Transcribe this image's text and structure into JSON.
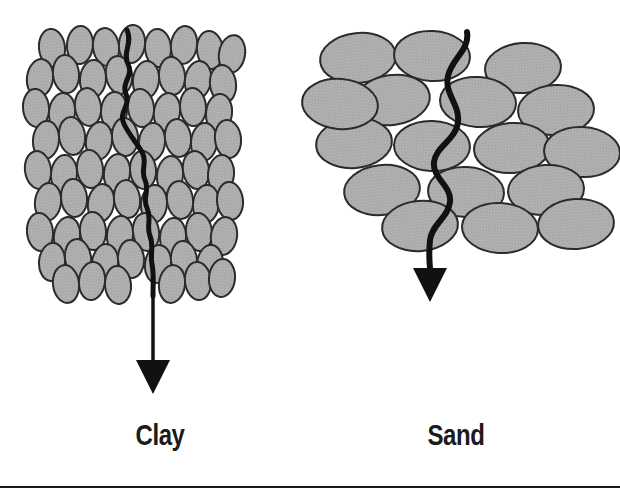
{
  "figure": {
    "width": 620,
    "height": 496,
    "background_color": "#ffffff"
  },
  "style": {
    "particle_fill": "#ababab",
    "particle_stroke": "#2b2b2b",
    "path_color": "#111111",
    "arrow_color": "#111111",
    "rule_color": "#1a1a1a",
    "caption_color": "#1b1b1b"
  },
  "panels": [
    {
      "id": "clay",
      "caption": "Clay",
      "caption_center_x": 160,
      "caption_baseline_y": 449,
      "particle_shape": "ellipse-vertical",
      "particle_count": 96,
      "particle_rx": 13,
      "particle_ry": 19,
      "packing": "dense",
      "block_bounds": {
        "x": 28,
        "y": 28,
        "width": 212,
        "height": 268
      },
      "path_description": "long tortuous vertical seepage path",
      "arrow": {
        "name": "clay-flow-arrow",
        "tip_y": 392,
        "length_below_block": 96,
        "head_width": 34,
        "head_height": 34
      }
    },
    {
      "id": "sand",
      "caption": "Sand",
      "caption_center_x": 456,
      "caption_baseline_y": 449,
      "particle_shape": "ellipse-horizontal",
      "particle_count": 17,
      "particle_rx": 38,
      "particle_ry": 25,
      "packing": "loose",
      "block_bounds": {
        "x": 318,
        "y": 28,
        "width": 276,
        "height": 218
      },
      "path_description": "short direct wavy seepage path",
      "arrow": {
        "name": "sand-flow-arrow",
        "tip_y": 300,
        "length_below_block": 56,
        "head_width": 34,
        "head_height": 34
      }
    }
  ],
  "rules": [
    {
      "name": "bottom-rule",
      "y": 486,
      "x1": 0,
      "x2": 620,
      "thickness": 2
    }
  ],
  "clay_particles": [
    {
      "cx": 52,
      "cy": 48,
      "r": -6
    },
    {
      "cx": 80,
      "cy": 45,
      "r": 4
    },
    {
      "cx": 106,
      "cy": 47,
      "r": -8
    },
    {
      "cx": 132,
      "cy": 44,
      "r": 6
    },
    {
      "cx": 158,
      "cy": 48,
      "r": -4
    },
    {
      "cx": 184,
      "cy": 45,
      "r": 8
    },
    {
      "cx": 210,
      "cy": 50,
      "r": -6
    },
    {
      "cx": 232,
      "cy": 54,
      "r": 10
    },
    {
      "cx": 40,
      "cy": 78,
      "r": 8
    },
    {
      "cx": 66,
      "cy": 74,
      "r": -6
    },
    {
      "cx": 93,
      "cy": 79,
      "r": 5
    },
    {
      "cx": 119,
      "cy": 75,
      "r": -9
    },
    {
      "cx": 146,
      "cy": 80,
      "r": 7
    },
    {
      "cx": 172,
      "cy": 76,
      "r": -5
    },
    {
      "cx": 198,
      "cy": 80,
      "r": 9
    },
    {
      "cx": 223,
      "cy": 84,
      "r": -7
    },
    {
      "cx": 36,
      "cy": 108,
      "r": -5
    },
    {
      "cx": 62,
      "cy": 112,
      "r": 7
    },
    {
      "cx": 88,
      "cy": 107,
      "r": -8
    },
    {
      "cx": 114,
      "cy": 111,
      "r": 4
    },
    {
      "cx": 141,
      "cy": 108,
      "r": -6
    },
    {
      "cx": 167,
      "cy": 112,
      "r": 9
    },
    {
      "cx": 193,
      "cy": 107,
      "r": -4
    },
    {
      "cx": 219,
      "cy": 113,
      "r": 6
    },
    {
      "cx": 46,
      "cy": 140,
      "r": 6
    },
    {
      "cx": 72,
      "cy": 136,
      "r": -7
    },
    {
      "cx": 99,
      "cy": 141,
      "r": 8
    },
    {
      "cx": 125,
      "cy": 137,
      "r": -5
    },
    {
      "cx": 152,
      "cy": 142,
      "r": 6
    },
    {
      "cx": 178,
      "cy": 138,
      "r": -8
    },
    {
      "cx": 204,
      "cy": 142,
      "r": 5
    },
    {
      "cx": 228,
      "cy": 139,
      "r": -6
    },
    {
      "cx": 38,
      "cy": 170,
      "r": -8
    },
    {
      "cx": 64,
      "cy": 174,
      "r": 5
    },
    {
      "cx": 90,
      "cy": 169,
      "r": -6
    },
    {
      "cx": 117,
      "cy": 173,
      "r": 8
    },
    {
      "cx": 143,
      "cy": 170,
      "r": -5
    },
    {
      "cx": 170,
      "cy": 175,
      "r": 7
    },
    {
      "cx": 196,
      "cy": 170,
      "r": -9
    },
    {
      "cx": 221,
      "cy": 174,
      "r": 5
    },
    {
      "cx": 48,
      "cy": 202,
      "r": 7
    },
    {
      "cx": 74,
      "cy": 198,
      "r": -5
    },
    {
      "cx": 101,
      "cy": 203,
      "r": 9
    },
    {
      "cx": 127,
      "cy": 199,
      "r": -7
    },
    {
      "cx": 154,
      "cy": 204,
      "r": 5
    },
    {
      "cx": 180,
      "cy": 200,
      "r": -8
    },
    {
      "cx": 206,
      "cy": 204,
      "r": 6
    },
    {
      "cx": 230,
      "cy": 201,
      "r": -5
    },
    {
      "cx": 40,
      "cy": 232,
      "r": -6
    },
    {
      "cx": 67,
      "cy": 236,
      "r": 8
    },
    {
      "cx": 93,
      "cy": 231,
      "r": -4
    },
    {
      "cx": 120,
      "cy": 235,
      "r": 6
    },
    {
      "cx": 146,
      "cy": 232,
      "r": -8
    },
    {
      "cx": 173,
      "cy": 237,
      "r": 5
    },
    {
      "cx": 199,
      "cy": 232,
      "r": -6
    },
    {
      "cx": 224,
      "cy": 236,
      "r": 9
    },
    {
      "cx": 52,
      "cy": 262,
      "r": 5
    },
    {
      "cx": 78,
      "cy": 258,
      "r": -8
    },
    {
      "cx": 105,
      "cy": 263,
      "r": 7
    },
    {
      "cx": 131,
      "cy": 259,
      "r": -5
    },
    {
      "cx": 158,
      "cy": 264,
      "r": 8
    },
    {
      "cx": 184,
      "cy": 260,
      "r": -6
    },
    {
      "cx": 210,
      "cy": 264,
      "r": 5
    },
    {
      "cx": 66,
      "cy": 284,
      "r": -7
    },
    {
      "cx": 92,
      "cy": 281,
      "r": 6
    },
    {
      "cx": 118,
      "cy": 285,
      "r": -5
    },
    {
      "cx": 172,
      "cy": 284,
      "r": 7
    },
    {
      "cx": 198,
      "cy": 281,
      "r": -6
    },
    {
      "cx": 222,
      "cy": 278,
      "r": 5
    }
  ],
  "sand_particles": [
    {
      "cx": 358,
      "cy": 58,
      "r": -6
    },
    {
      "cx": 432,
      "cy": 56,
      "r": 3
    },
    {
      "cx": 523,
      "cy": 68,
      "r": -4
    },
    {
      "cx": 392,
      "cy": 100,
      "r": -8
    },
    {
      "cx": 478,
      "cy": 102,
      "r": 4
    },
    {
      "cx": 556,
      "cy": 110,
      "r": -3
    },
    {
      "cx": 354,
      "cy": 143,
      "r": -5
    },
    {
      "cx": 432,
      "cy": 146,
      "r": 2
    },
    {
      "cx": 512,
      "cy": 148,
      "r": -4
    },
    {
      "cx": 582,
      "cy": 152,
      "r": 3
    },
    {
      "cx": 382,
      "cy": 190,
      "r": -6
    },
    {
      "cx": 466,
      "cy": 192,
      "r": 3
    },
    {
      "cx": 546,
      "cy": 190,
      "r": -4
    },
    {
      "cx": 420,
      "cy": 226,
      "r": -5
    },
    {
      "cx": 500,
      "cy": 228,
      "r": 3
    },
    {
      "cx": 576,
      "cy": 224,
      "r": -4
    },
    {
      "cx": 340,
      "cy": 104,
      "r": 5
    }
  ]
}
